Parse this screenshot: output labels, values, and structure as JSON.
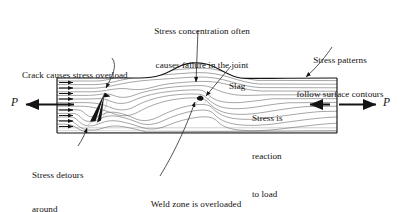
{
  "figure": {
    "type": "technical-illustration",
    "background_color": "#ffffff",
    "ink_color": "#141414",
    "flowline_color": "#6e6e6e"
  },
  "plate": {
    "label": "steel-plate-section",
    "left_x": 57,
    "right_x": 337,
    "top_y": 78,
    "bottom_y": 133,
    "weld_crown_center_x": 196,
    "weld_crown_peak_y": 63
  },
  "load": {
    "left_symbol": "P",
    "right_symbol": "P",
    "left_arrow_direction": "left",
    "right_arrow_direction": "right",
    "reaction_arrow_direction": "left",
    "distributed_arrow_count": 9,
    "distributed_arrow_direction": "right"
  },
  "annotations": {
    "stress_concentration": {
      "line1": "Stress concentration often",
      "line2": "causes failure in the joint"
    },
    "crack": {
      "line1": "Crack causes stress overload"
    },
    "surface_contours": {
      "line1": "Stress patterns",
      "line2": "follow surface contours"
    },
    "slag": {
      "line1": "Slag"
    },
    "reaction": {
      "line1": "Stress is",
      "line2": "reaction",
      "line3": "to load"
    },
    "detours": {
      "line1": "Stress detours",
      "line2": "around",
      "line3": "discontinuities"
    },
    "weld_zone": {
      "line1": "Weld zone is overloaded",
      "line2": "at the inclusion"
    }
  },
  "features": [
    {
      "name": "crack",
      "x": 104,
      "y": 95
    },
    {
      "name": "slag-inclusion",
      "x": 199,
      "y": 99
    },
    {
      "name": "weld-bead-crown",
      "x": 196,
      "y": 66
    },
    {
      "name": "discontinuity-notch",
      "x": 88,
      "y": 125
    }
  ]
}
